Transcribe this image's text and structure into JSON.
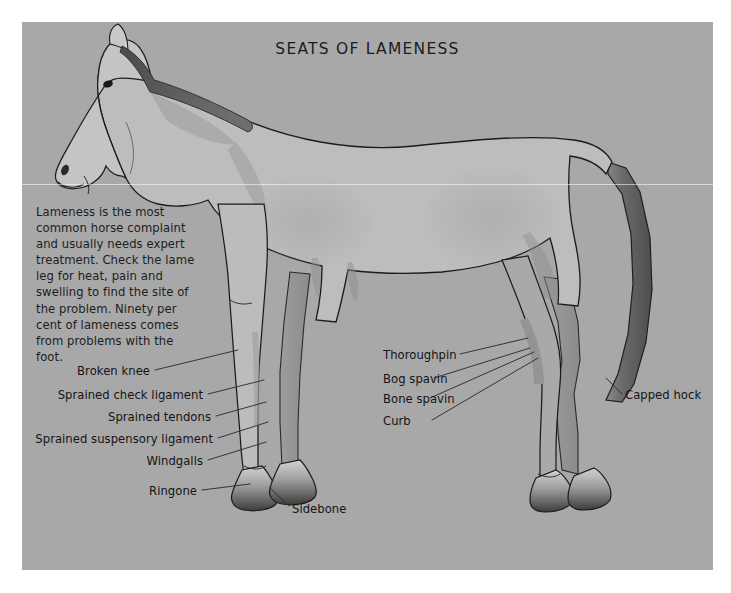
{
  "figure": {
    "title": "SEATS OF LAMENESS",
    "background_color": "#a8a8a8",
    "page_color": "#ffffff",
    "text_color": "#141414",
    "horse_body_color": "#bdbdbd",
    "horse_shadow_color": "#9a9a9a",
    "horse_dark_color": "#5e5e5e",
    "outline_color": "#1b1b1b",
    "leader_line_color": "#2a2a2a"
  },
  "intro": {
    "paragraph": "Lameness is the most common horse complaint and usually needs expert treatment. Check the lame leg for heat, pain and swelling to find the site of the problem. Ninety per cent of lameness comes from problems with the foot."
  },
  "annotations": {
    "left": [
      {
        "label": "Broken knee"
      },
      {
        "label": "Sprained check ligament"
      },
      {
        "label": "Sprained tendons"
      },
      {
        "label": "Sprained suspensory ligament"
      },
      {
        "label": "Windgalls"
      },
      {
        "label": "Ringone"
      }
    ],
    "below": [
      {
        "label": "Sidebone"
      }
    ],
    "right": [
      {
        "label": "Thoroughpin"
      },
      {
        "label": "Bog spavin"
      },
      {
        "label": "Bone spavin"
      },
      {
        "label": "Curb"
      }
    ],
    "far_right": [
      {
        "label": "Capped hock"
      }
    ]
  },
  "illustration": {
    "subject": "horse-lateral-view",
    "parts": [
      "head",
      "mane",
      "neck",
      "body",
      "tail",
      "foreleg-near",
      "foreleg-far",
      "hindleg-near",
      "hindleg-far",
      "hooves"
    ]
  }
}
